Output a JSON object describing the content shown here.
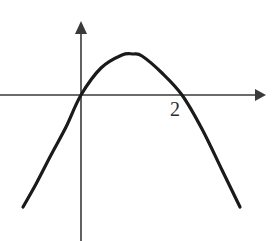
{
  "figure": {
    "title": "",
    "background_color": "#ffffff",
    "width": 272,
    "height": 241
  },
  "axes": {
    "axis_color": "#3a3a3a",
    "axis_stroke_width": 1.6,
    "x_axis": {
      "name": "x-axis",
      "y_pixel": 95,
      "x_start_pixel": 0,
      "x_end_pixel": 265,
      "arrow": "right"
    },
    "y_axis": {
      "name": "y-axis",
      "x_pixel": 81,
      "y_start_pixel": 22,
      "y_end_pixel": 241,
      "arrow": "up"
    }
  },
  "labels": [
    {
      "text": "2",
      "name": "x-intercept-label-2",
      "left_pixel": 170,
      "top_pixel": 99,
      "font_size": 20,
      "color": "#2b2b2b"
    }
  ],
  "chart_data": {
    "type": "line",
    "title": "",
    "subtitle": "",
    "xlabel": "",
    "ylabel": "",
    "grid": false,
    "legend": null,
    "curve_color": "#1a1a1a",
    "curve_stroke_width": 3.2,
    "equation": "y = -a x (x - 2)",
    "roots": [
      0,
      2
    ],
    "vertex": [
      1,
      1
    ],
    "opens": "down",
    "axis_ranges": {
      "x_pixels": [
        0,
        272
      ],
      "y_pixels": [
        0,
        241
      ],
      "origin_pixel": [
        81,
        95
      ],
      "x_unit_pixels": 50.5
    },
    "x": [
      -1.15,
      -0.9,
      -0.6,
      -0.3,
      0,
      0.4,
      0.8,
      1.0,
      1.2,
      1.6,
      2.0,
      2.4,
      2.8,
      3.15
    ],
    "y_pixels": [
      207,
      184,
      155,
      127,
      95,
      68,
      55,
      54,
      56,
      73,
      95,
      129,
      170,
      207
    ],
    "x_pixels": [
      23,
      36,
      51,
      66,
      81,
      101,
      122,
      132,
      142,
      162,
      182,
      202,
      222,
      240
    ],
    "points": [
      {
        "x_px": 23,
        "y_px": 207
      },
      {
        "x_px": 36,
        "y_px": 184
      },
      {
        "x_px": 51,
        "y_px": 155
      },
      {
        "x_px": 66,
        "y_px": 127
      },
      {
        "x_px": 81,
        "y_px": 95
      },
      {
        "x_px": 101,
        "y_px": 68
      },
      {
        "x_px": 122,
        "y_px": 55
      },
      {
        "x_px": 133,
        "y_px": 54
      },
      {
        "x_px": 142,
        "y_px": 56
      },
      {
        "x_px": 162,
        "y_px": 73
      },
      {
        "x_px": 182,
        "y_px": 95
      },
      {
        "x_px": 202,
        "y_px": 129
      },
      {
        "x_px": 222,
        "y_px": 170
      },
      {
        "x_px": 240,
        "y_px": 207
      }
    ]
  }
}
